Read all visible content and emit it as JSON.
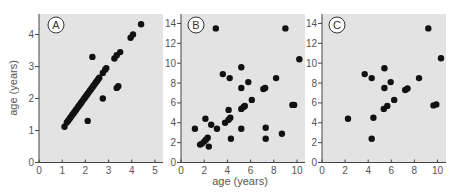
{
  "chart_data": [
    {
      "type": "scatter",
      "panel": "A",
      "title": "",
      "xlabel": "",
      "ylabel": "age (years)",
      "xlim": [
        0,
        5.3
      ],
      "ylim": [
        0,
        4.6
      ],
      "xticks": [
        0,
        1,
        2,
        3,
        4,
        5
      ],
      "yticks": [
        0,
        1,
        2,
        3,
        4
      ],
      "grid": false,
      "points": [
        [
          1.1,
          1.12
        ],
        [
          1.2,
          1.25
        ],
        [
          1.25,
          1.3
        ],
        [
          1.3,
          1.35
        ],
        [
          1.35,
          1.4
        ],
        [
          1.4,
          1.45
        ],
        [
          1.45,
          1.5
        ],
        [
          1.5,
          1.55
        ],
        [
          1.55,
          1.6
        ],
        [
          1.6,
          1.65
        ],
        [
          1.65,
          1.7
        ],
        [
          1.7,
          1.75
        ],
        [
          1.75,
          1.8
        ],
        [
          1.8,
          1.85
        ],
        [
          1.85,
          1.9
        ],
        [
          1.9,
          1.95
        ],
        [
          1.95,
          2.0
        ],
        [
          2.0,
          2.05
        ],
        [
          2.05,
          2.1
        ],
        [
          2.1,
          2.15
        ],
        [
          2.15,
          2.2
        ],
        [
          2.2,
          2.25
        ],
        [
          2.25,
          2.3
        ],
        [
          2.3,
          2.35
        ],
        [
          2.35,
          2.4
        ],
        [
          2.4,
          2.45
        ],
        [
          2.45,
          2.5
        ],
        [
          2.5,
          2.55
        ],
        [
          2.55,
          2.6
        ],
        [
          2.6,
          2.65
        ],
        [
          2.75,
          2.8
        ],
        [
          2.85,
          2.9
        ],
        [
          2.9,
          2.95
        ],
        [
          2.3,
          3.3
        ],
        [
          2.75,
          2.0
        ],
        [
          2.1,
          1.3
        ],
        [
          3.35,
          2.33
        ],
        [
          3.42,
          2.38
        ],
        [
          3.25,
          3.25
        ],
        [
          3.35,
          3.35
        ],
        [
          3.5,
          3.45
        ],
        [
          3.95,
          3.9
        ],
        [
          4.05,
          4.0
        ],
        [
          4.4,
          4.32
        ]
      ]
    },
    {
      "type": "scatter",
      "panel": "B",
      "title": "",
      "xlabel": "age (years)",
      "ylabel": "",
      "xlim": [
        0,
        10.7
      ],
      "ylim": [
        0,
        14.9
      ],
      "xticks": [
        0,
        2,
        4,
        6,
        8,
        10
      ],
      "yticks": [
        0,
        2,
        4,
        6,
        8,
        10,
        12,
        14
      ],
      "grid": false,
      "points": [
        [
          3.0,
          13.5
        ],
        [
          9.0,
          13.5
        ],
        [
          10.2,
          10.4
        ],
        [
          5.2,
          9.6
        ],
        [
          3.6,
          8.9
        ],
        [
          4.2,
          8.5
        ],
        [
          5.8,
          8.1
        ],
        [
          8.2,
          8.5
        ],
        [
          5.2,
          7.5
        ],
        [
          7.1,
          7.4
        ],
        [
          7.25,
          7.5
        ],
        [
          6.1,
          6.3
        ],
        [
          4.1,
          5.3
        ],
        [
          5.2,
          5.4
        ],
        [
          5.4,
          5.6
        ],
        [
          5.5,
          5.7
        ],
        [
          9.6,
          5.8
        ],
        [
          9.75,
          5.8
        ],
        [
          2.1,
          4.4
        ],
        [
          4.1,
          4.3
        ],
        [
          4.25,
          4.5
        ],
        [
          3.8,
          4.0
        ],
        [
          2.6,
          3.8
        ],
        [
          1.2,
          3.4
        ],
        [
          3.1,
          3.4
        ],
        [
          5.2,
          3.4
        ],
        [
          7.3,
          3.5
        ],
        [
          8.7,
          2.9
        ],
        [
          2.3,
          2.5
        ],
        [
          2.15,
          2.3
        ],
        [
          2.0,
          2.1
        ],
        [
          1.8,
          1.9
        ],
        [
          1.65,
          1.8
        ],
        [
          4.3,
          2.4
        ],
        [
          7.3,
          2.4
        ],
        [
          2.4,
          1.6
        ]
      ]
    },
    {
      "type": "scatter",
      "panel": "C",
      "title": "",
      "xlabel": "",
      "ylabel": "",
      "xlim": [
        0,
        10.7
      ],
      "ylim": [
        0,
        14.9
      ],
      "xticks": [
        0,
        2,
        4,
        6,
        8,
        10
      ],
      "yticks": [
        0,
        2,
        4,
        6,
        8,
        10,
        12,
        14
      ],
      "grid": false,
      "points": [
        [
          9.2,
          13.5
        ],
        [
          10.3,
          10.5
        ],
        [
          5.4,
          9.5
        ],
        [
          3.7,
          8.9
        ],
        [
          4.3,
          8.5
        ],
        [
          5.95,
          8.1
        ],
        [
          8.4,
          8.5
        ],
        [
          5.4,
          7.5
        ],
        [
          7.2,
          7.3
        ],
        [
          7.4,
          7.45
        ],
        [
          6.25,
          6.3
        ],
        [
          5.35,
          5.4
        ],
        [
          5.65,
          5.7
        ],
        [
          9.65,
          5.75
        ],
        [
          9.9,
          5.85
        ],
        [
          2.25,
          4.4
        ],
        [
          4.45,
          4.5
        ],
        [
          4.3,
          2.4
        ]
      ]
    }
  ],
  "panels": {
    "a": {
      "letter": "A",
      "ylabel": "age (years)",
      "xticks": [
        "0",
        "1",
        "2",
        "3",
        "4",
        "5"
      ],
      "yticks": [
        "0",
        "1",
        "2",
        "3",
        "4"
      ]
    },
    "b": {
      "letter": "B",
      "xlabel": "age (years)",
      "xticks": [
        "0",
        "2",
        "4",
        "6",
        "8",
        "10"
      ],
      "yticks": [
        "0",
        "2",
        "4",
        "6",
        "8",
        "10",
        "12",
        "14"
      ]
    },
    "c": {
      "letter": "C",
      "xticks": [
        "0",
        "2",
        "4",
        "6",
        "8",
        "10"
      ],
      "yticks": [
        "0",
        "2",
        "4",
        "6",
        "8",
        "10",
        "12",
        "14"
      ]
    }
  },
  "colors": {
    "plot_background": "#e3e3e3",
    "axis": "#444444",
    "point": "#111111",
    "text": "#555555"
  }
}
